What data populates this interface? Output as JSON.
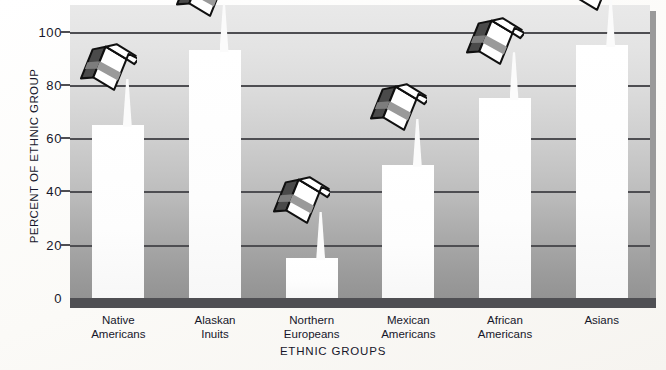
{
  "chart_data": {
    "type": "bar",
    "title": "",
    "xlabel": "ETHNIC GROUPS",
    "ylabel": "PERCENT OF ETHNIC GROUP",
    "categories": [
      "Native Americans",
      "Alaskan Inuits",
      "Northern Europeans",
      "Mexican Americans",
      "African Americans",
      "Asians"
    ],
    "category_lines": [
      [
        "Native",
        "Americans"
      ],
      [
        "Alaskan",
        "Inuits"
      ],
      [
        "Northern",
        "Europeans"
      ],
      [
        "Mexican",
        "Americans"
      ],
      [
        "African",
        "Americans"
      ],
      [
        "Asians"
      ]
    ],
    "values": [
      65,
      93,
      15,
      50,
      75,
      95
    ],
    "ylim": [
      0,
      110
    ],
    "yticks": [
      0,
      20,
      40,
      60,
      80,
      100
    ],
    "ytick_labels": [
      "0",
      "20",
      "40",
      "60",
      "80",
      "100"
    ],
    "grid": true,
    "gridlines_at": [
      20,
      40,
      60,
      80,
      100
    ],
    "legend": "none",
    "annotations": [
      "milk-carton icon pouring into each bar"
    ]
  },
  "colors": {
    "bar_fill": "#ffffff",
    "gridline": "#4e4e52",
    "axis": "#4f4f53",
    "plot_bg_top": "#e9e9e9",
    "plot_bg_bottom": "#939393",
    "carton_outline": "#101010",
    "carton_side": "#4a4a4a",
    "carton_band": "#9a9a9a",
    "text": "#16162a"
  },
  "axis": {
    "y_title": "PERCENT OF ETHNIC GROUP",
    "x_title": "ETHNIC GROUPS"
  }
}
